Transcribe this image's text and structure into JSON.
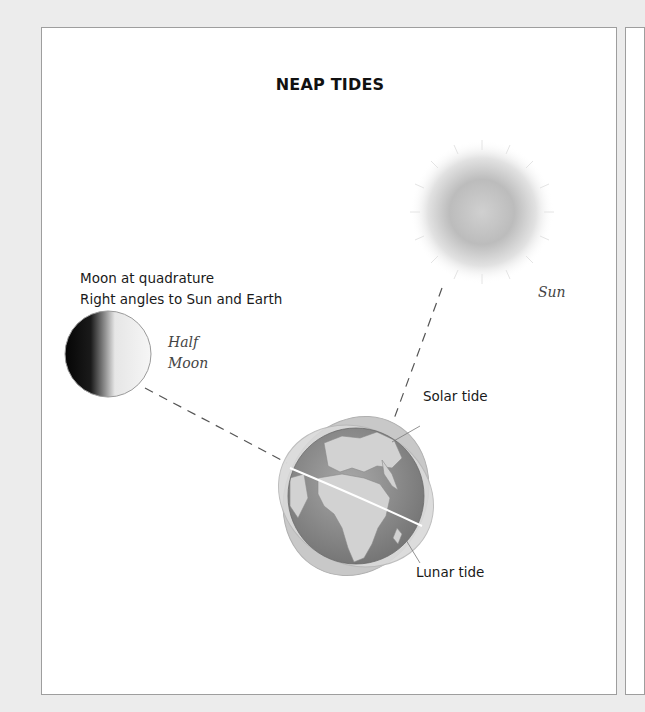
{
  "diagram": {
    "title": "NEAP TIDES",
    "caption": {
      "line1": "Moon at quadrature",
      "line2": "Right angles to Sun and Earth"
    },
    "bodies": {
      "moon": {
        "label_line1": "Half",
        "label_line2": "Moon"
      },
      "sun": {
        "label": "Sun"
      },
      "earth": {
        "label": "Earth"
      }
    },
    "callouts": {
      "solar_tide": "Solar tide",
      "lunar_tide": "Lunar tide"
    },
    "colors": {
      "background": "#ececec",
      "panel": "#ffffff",
      "border": "#9e9e9e",
      "sun_core": "#bdbdbd",
      "earth_ocean": "#8a8a8a",
      "earth_land": "#d4d4d4",
      "tide_bulge": "#c4c4c4"
    }
  }
}
